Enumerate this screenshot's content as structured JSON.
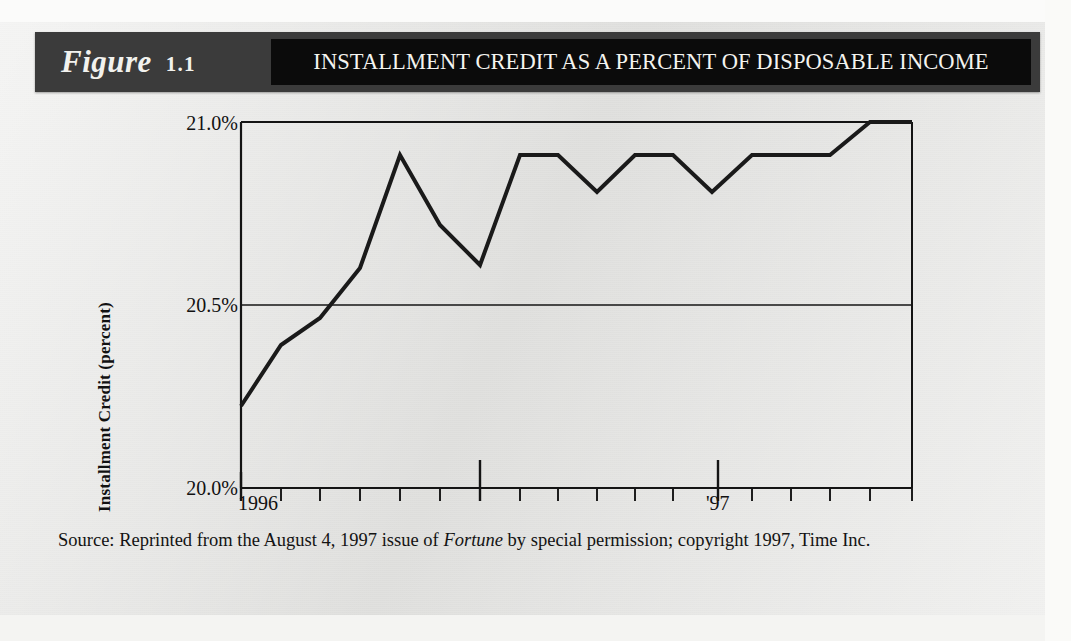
{
  "figure": {
    "label_word": "Figure",
    "number": "1.1",
    "title": "INSTALLMENT CREDIT AS A PERCENT OF DISPOSABLE INCOME",
    "band_color": "#3b3b3b",
    "title_band_color": "#0b0b0b",
    "title_text_color": "#f4f4f0"
  },
  "source": {
    "prefix": "Source: Reprinted from the August 4, 1997 issue of ",
    "publication": "Fortune",
    "suffix": " by special permission; copyright 1997, Time Inc."
  },
  "chart_data": {
    "type": "line",
    "title": "INSTALLMENT CREDIT AS A PERCENT OF DISPOSABLE INCOME",
    "xlabel": "",
    "ylabel": "Installment Credit (percent)",
    "ylim": [
      20.0,
      21.0
    ],
    "ytick_values": [
      21.0,
      20.5,
      20.0
    ],
    "ytick_labels": [
      "21.0%",
      "20.5%",
      "20.0%"
    ],
    "xtick_major_labels": [
      "1996",
      "'97"
    ],
    "xtick_major_positions": [
      0,
      6
    ],
    "x_minor_tick_count": 18,
    "grid": "horizontal-at-ticks",
    "legend": "none",
    "line_color": "#1a1a1a",
    "line_width_px": 4,
    "x": [
      0,
      1,
      2,
      3,
      4,
      5,
      6,
      7,
      8,
      9,
      10,
      11,
      12,
      13,
      14,
      15,
      16,
      17
    ],
    "values": [
      20.2,
      20.37,
      20.45,
      20.52,
      20.6,
      20.73,
      20.92,
      20.79,
      20.68,
      20.6,
      20.79,
      20.92,
      20.92,
      20.92,
      20.82,
      20.92,
      20.92,
      20.92
    ],
    "vertices_pixel": [
      [
        241,
        406
      ],
      [
        281,
        345
      ],
      [
        320,
        318
      ],
      [
        360,
        268
      ],
      [
        400,
        155
      ],
      [
        440,
        225
      ],
      [
        480,
        265
      ],
      [
        520,
        155
      ],
      [
        558,
        155
      ],
      [
        597,
        192
      ],
      [
        635,
        155
      ],
      [
        673,
        155
      ],
      [
        712,
        192
      ],
      [
        752,
        155
      ],
      [
        830,
        155
      ],
      [
        870,
        122
      ],
      [
        912,
        122
      ]
    ],
    "annotations": []
  }
}
